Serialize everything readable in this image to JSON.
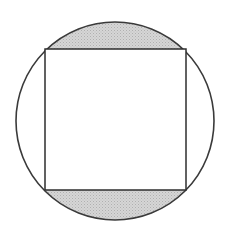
{
  "figure": {
    "title": "Square inscribed in a circle with shaded circular segments",
    "type": "geometry-diagram",
    "canvas": {
      "width": 226,
      "height": 232,
      "background_color": "#ffffff"
    },
    "circle": {
      "name": "outer-circle",
      "center_x": 115,
      "center_y": 121,
      "radius": 99,
      "stroke_color": "#3a3a3a",
      "stroke_width": 1.6,
      "fill_color": "#ffffff"
    },
    "square": {
      "name": "inner-square",
      "left": 45,
      "top": 49,
      "right": 186,
      "bottom": 190,
      "width": 141,
      "height": 141,
      "stroke_color": "#2e2e2e",
      "stroke_width": 1.5,
      "fill_color": "#ffffff",
      "corners": [
        {
          "label": "top-left",
          "x": 45,
          "y": 49
        },
        {
          "label": "top-right",
          "x": 186,
          "y": 49
        },
        {
          "label": "bottom-right",
          "x": 186,
          "y": 190
        },
        {
          "label": "bottom-left",
          "x": 45,
          "y": 190
        }
      ]
    },
    "shaded_regions": [
      {
        "name": "top-segment",
        "description": "circular segment above the top edge of the square",
        "fill_color": "#cfcfcf",
        "pattern": "stipple",
        "chord_y": 49
      },
      {
        "name": "bottom-segment",
        "description": "circular segment below the bottom edge of the square",
        "fill_color": "#cfcfcf",
        "pattern": "stipple",
        "chord_y": 190
      }
    ],
    "unshaded_regions": [
      {
        "name": "left-segment",
        "description": "circular segment left of the square",
        "fill_color": "#ffffff"
      },
      {
        "name": "right-segment",
        "description": "circular segment right of the square",
        "fill_color": "#ffffff"
      },
      {
        "name": "square-interior",
        "description": "interior of the inscribed square",
        "fill_color": "#ffffff"
      }
    ],
    "colors": {
      "shade": "#cfcfcf",
      "shade_dots": "#a8a8a8",
      "circle_stroke": "#3a3a3a",
      "square_stroke": "#2e2e2e",
      "background": "#ffffff"
    }
  }
}
